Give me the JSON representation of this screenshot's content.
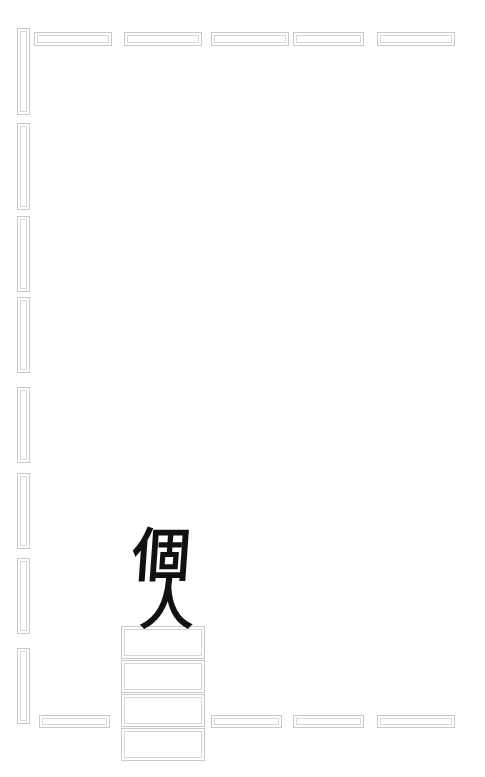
{
  "canvas": {
    "width": 485,
    "height": 777,
    "background": "#ffffff",
    "border_color": "#c9c9c9",
    "inner_border_color": "#d6d6d6",
    "ink_color": "#111111"
  },
  "calligraphy": {
    "name": "calligraphy-overlay",
    "text": "個人",
    "characters": [
      "個",
      "人"
    ],
    "reading": "kojin",
    "meaning": "individual / personal"
  },
  "sidebar": {
    "name": "left-rail",
    "items": [
      {
        "label": "",
        "x": 17,
        "y": 28,
        "w": 13,
        "h": 87
      },
      {
        "label": "",
        "x": 17,
        "y": 123,
        "w": 13,
        "h": 87
      },
      {
        "label": "",
        "x": 17,
        "y": 216,
        "w": 13,
        "h": 76
      },
      {
        "label": "",
        "x": 17,
        "y": 297,
        "w": 13,
        "h": 76
      },
      {
        "label": "",
        "x": 17,
        "y": 387,
        "w": 13,
        "h": 76
      },
      {
        "label": "",
        "x": 17,
        "y": 473,
        "w": 13,
        "h": 76
      },
      {
        "label": "",
        "x": 17,
        "y": 558,
        "w": 13,
        "h": 76
      },
      {
        "label": "",
        "x": 17,
        "y": 648,
        "w": 13,
        "h": 76
      }
    ]
  },
  "top_row": {
    "name": "top-bar",
    "items": [
      {
        "label": "",
        "x": 124,
        "y": 32,
        "w": 78,
        "h": 14
      },
      {
        "label": "",
        "x": 211,
        "y": 32,
        "w": 78,
        "h": 14
      },
      {
        "label": "",
        "x": 293,
        "y": 32,
        "w": 71,
        "h": 14
      },
      {
        "label": "",
        "x": 377,
        "y": 32,
        "w": 78,
        "h": 14
      },
      {
        "label": "",
        "x": 34,
        "y": 32,
        "w": 78,
        "h": 14
      }
    ]
  },
  "bottom_row": {
    "name": "bottom-bar",
    "items": [
      {
        "label": "",
        "x": 39,
        "y": 715,
        "w": 71,
        "h": 13
      },
      {
        "label": "",
        "x": 211,
        "y": 715,
        "w": 71,
        "h": 13
      },
      {
        "label": "",
        "x": 293,
        "y": 715,
        "w": 71,
        "h": 13
      },
      {
        "label": "",
        "x": 377,
        "y": 715,
        "w": 78,
        "h": 13
      }
    ]
  },
  "center_stack": {
    "name": "center-card-stack",
    "items": [
      {
        "label": "",
        "x": 121,
        "y": 626,
        "w": 84,
        "h": 33
      },
      {
        "label": "",
        "x": 121,
        "y": 660,
        "w": 84,
        "h": 33
      },
      {
        "label": "",
        "x": 121,
        "y": 694,
        "w": 84,
        "h": 33
      },
      {
        "label": "",
        "x": 121,
        "y": 728,
        "w": 84,
        "h": 33
      }
    ]
  }
}
